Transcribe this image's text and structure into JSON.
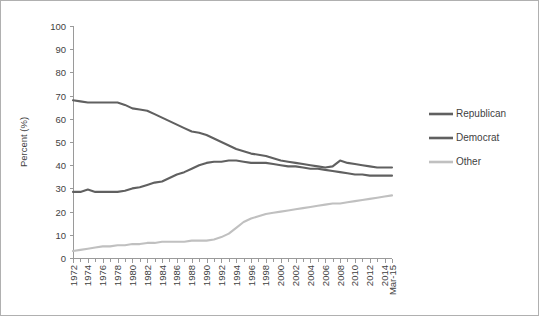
{
  "chart_data": {
    "type": "line",
    "title": "",
    "xlabel": "",
    "ylabel": "Percent (%)",
    "ylim": [
      0,
      100
    ],
    "ytick_step": 10,
    "yticks": [
      "0",
      "10",
      "20",
      "30",
      "40",
      "50",
      "60",
      "70",
      "80",
      "90",
      "100"
    ],
    "grid": false,
    "legend_position": "right",
    "categories": [
      "1972",
      "1973",
      "1974",
      "1975",
      "1976",
      "1977",
      "1978",
      "1979",
      "1980",
      "1981",
      "1982",
      "1983",
      "1984",
      "1985",
      "1986",
      "1987",
      "1988",
      "1989",
      "1990",
      "1991",
      "1992",
      "1993",
      "1994",
      "1995",
      "1996",
      "1997",
      "1998",
      "1999",
      "2000",
      "2001",
      "2002",
      "2003",
      "2004",
      "2005",
      "2006",
      "2007",
      "2008",
      "2009",
      "2010",
      "2011",
      "2012",
      "2013",
      "2014",
      "Mar-15"
    ],
    "xtick_labels": [
      "1972",
      "1974",
      "1976",
      "1978",
      "1980",
      "1982",
      "1984",
      "1986",
      "1988",
      "1990",
      "1992",
      "1994",
      "1996",
      "1998",
      "2000",
      "2002",
      "2004",
      "2006",
      "2008",
      "2010",
      "2012",
      "2014",
      "Mar-15"
    ],
    "series": [
      {
        "name": "Republican",
        "color": "#606060",
        "values": [
          68.0,
          67.5,
          67.0,
          67.0,
          67.0,
          67.0,
          67.0,
          66.0,
          64.5,
          64.0,
          63.5,
          62.0,
          60.5,
          59.0,
          57.5,
          56.0,
          54.5,
          54.0,
          53.0,
          51.5,
          50.0,
          48.5,
          47.0,
          46.0,
          45.0,
          44.5,
          44.0,
          43.0,
          42.0,
          41.5,
          41.0,
          40.5,
          40.0,
          39.5,
          39.0,
          39.5,
          42.0,
          41.0,
          40.5,
          40.0,
          39.5,
          39.0,
          39.0,
          39.0
        ]
      },
      {
        "name": "Democrat",
        "color": "#606060",
        "values": [
          28.5,
          28.5,
          29.5,
          28.5,
          28.5,
          28.5,
          28.5,
          29.0,
          30.0,
          30.5,
          31.5,
          32.5,
          33.0,
          34.5,
          36.0,
          37.0,
          38.5,
          40.0,
          41.0,
          41.5,
          41.5,
          42.0,
          42.0,
          41.5,
          41.0,
          41.0,
          41.0,
          40.5,
          40.0,
          39.5,
          39.5,
          39.0,
          38.5,
          38.5,
          38.0,
          37.5,
          37.0,
          36.5,
          36.0,
          36.0,
          35.5,
          35.5,
          35.5,
          35.5
        ]
      },
      {
        "name": "Other",
        "color": "#c0c0c0",
        "values": [
          3.0,
          3.5,
          4.0,
          4.5,
          5.0,
          5.0,
          5.5,
          5.5,
          6.0,
          6.0,
          6.5,
          6.5,
          7.0,
          7.0,
          7.0,
          7.0,
          7.5,
          7.5,
          7.5,
          8.0,
          9.0,
          10.5,
          13.0,
          15.5,
          17.0,
          18.0,
          19.0,
          19.5,
          20.0,
          20.5,
          21.0,
          21.5,
          22.0,
          22.5,
          23.0,
          23.5,
          23.5,
          24.0,
          24.5,
          25.0,
          25.5,
          26.0,
          26.5,
          27.0
        ]
      }
    ],
    "legend": [
      {
        "label": "Republican",
        "color": "#606060"
      },
      {
        "label": "Democrat",
        "color": "#606060"
      },
      {
        "label": "Other",
        "color": "#c0c0c0"
      }
    ]
  }
}
